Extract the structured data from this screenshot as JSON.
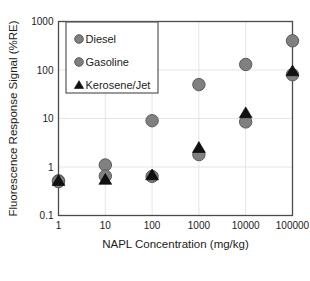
{
  "chart_data": {
    "type": "scatter",
    "title": "",
    "xlabel": "NAPL Concentration (mg/kg)",
    "ylabel": "Fluorescence Response Signal (%RE)",
    "xscale": "log",
    "yscale": "log",
    "xlim": [
      1,
      100000
    ],
    "ylim": [
      0.1,
      1000
    ],
    "xticks": [
      "1",
      "10",
      "100",
      "1000",
      "10000",
      "100000"
    ],
    "xtick_values": [
      1,
      10,
      100,
      1000,
      10000,
      100000
    ],
    "yticks": [
      "1000",
      "100",
      "10",
      "1",
      "0.1"
    ],
    "ytick_values": [
      1000,
      100,
      10,
      1,
      0.1
    ],
    "grid": true,
    "legend_position": "upper-left",
    "legend": [
      "Diesel",
      "Gasoline",
      "Kerosene/Jet"
    ],
    "series": [
      {
        "name": "Diesel",
        "marker": "circle",
        "color": "#808080",
        "edge_color": "#5b5b5b",
        "x": [
          1,
          10,
          100,
          1000,
          10000,
          100000
        ],
        "y": [
          0.52,
          1.1,
          9.0,
          50,
          130,
          400
        ]
      },
      {
        "name": "Gasoline",
        "marker": "circle",
        "color": "#808080",
        "edge_color": "#5b5b5b",
        "x": [
          1,
          10,
          100,
          1000,
          10000,
          100000
        ],
        "y": [
          0.5,
          0.65,
          0.64,
          1.8,
          8.5,
          80
        ]
      },
      {
        "name": "Kerosene/Jet",
        "marker": "triangle",
        "color": "#111111",
        "edge_color": "#000000",
        "x": [
          1,
          10,
          100,
          1000,
          10000,
          100000
        ],
        "y": [
          0.52,
          0.55,
          0.68,
          2.5,
          13,
          95
        ]
      }
    ]
  }
}
